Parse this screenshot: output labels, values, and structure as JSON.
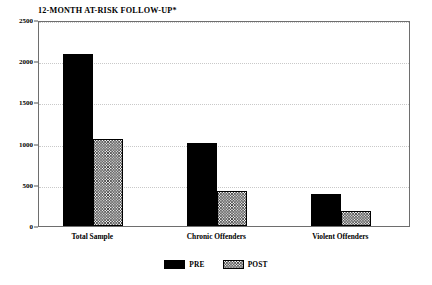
{
  "chart_data": {
    "type": "bar",
    "title": "12-MONTH AT-RISK FOLLOW-UP*",
    "xlabel": "",
    "ylabel": "",
    "ylim": [
      0,
      2500
    ],
    "yticks": [
      0,
      500,
      1000,
      1500,
      2000,
      2500
    ],
    "ytick_labels": [
      "0",
      "500",
      "1000",
      "1500",
      "2000",
      "2500"
    ],
    "grid": true,
    "grid_axis": "y",
    "legend_position": "bottom-center",
    "categories": [
      "Total Sample",
      "Chronic Offenders",
      "Violent Offenders"
    ],
    "series": [
      {
        "name": "PRE",
        "color": "#000000",
        "pattern": "solid",
        "values": [
          2090,
          1010,
          390
        ]
      },
      {
        "name": "POST",
        "color": "#ffffff",
        "pattern": "cross-hatch",
        "values": [
          1050,
          420,
          180
        ]
      }
    ]
  },
  "legend": {
    "items": [
      {
        "label": "PRE",
        "swatch": "solid-black-swatch"
      },
      {
        "label": "POST",
        "swatch": "hatched-swatch"
      }
    ]
  }
}
